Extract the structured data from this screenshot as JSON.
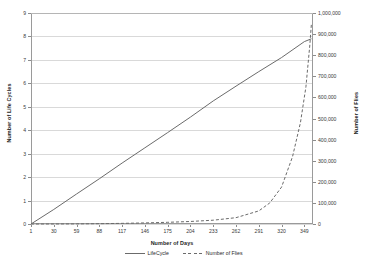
{
  "chart_data": {
    "type": "line",
    "title": "",
    "xlabel": "Number of Days",
    "ylabel": "Number of Life Cycles",
    "y2label": "Number of Flies",
    "xlim": [
      1,
      360
    ],
    "ylim": [
      0,
      9
    ],
    "y2lim": [
      0,
      1000000
    ],
    "grid": true,
    "legend_position": "bottom",
    "x_ticks": [
      "1",
      "30",
      "59",
      "88",
      "117",
      "146",
      "175",
      "204",
      "233",
      "262",
      "291",
      "320",
      "349"
    ],
    "y_left_ticks": [
      "0",
      "1",
      "2",
      "3",
      "4",
      "5",
      "6",
      "7",
      "8",
      "9"
    ],
    "y_right_ticks": [
      "0",
      "100,000",
      "200,000",
      "300,000",
      "400,000",
      "500,000",
      "600,000",
      "700,000",
      "800,000",
      "900,000",
      "1,000,000"
    ],
    "series": [
      {
        "name": "LifeCycle",
        "axis": "left",
        "style": "solid",
        "color": "#6b6b6b",
        "x": [
          1,
          30,
          59,
          88,
          117,
          146,
          175,
          204,
          233,
          262,
          291,
          320,
          349,
          358
        ],
        "values": [
          0,
          0.62,
          1.28,
          1.93,
          2.6,
          3.25,
          3.9,
          4.56,
          5.25,
          5.88,
          6.5,
          7.1,
          7.78,
          7.9
        ]
      },
      {
        "name": "Number of Flies",
        "axis": "right",
        "style": "dashed",
        "color": "#6b6b6b",
        "x": [
          1,
          30,
          59,
          88,
          117,
          146,
          175,
          204,
          233,
          262,
          291,
          305,
          320,
          334,
          344,
          351,
          356,
          358
        ],
        "values": [
          0,
          200,
          600,
          1500,
          3000,
          5000,
          8000,
          12000,
          18000,
          30000,
          62000,
          100000,
          175000,
          320000,
          480000,
          650000,
          850000,
          950000
        ]
      }
    ]
  },
  "axes": {
    "x_title": "Number of Days",
    "y_left_title": "Number of Life Cycles",
    "y_right_title": "Number of Flies"
  },
  "legend": {
    "entries": [
      {
        "label": "LifeCycle",
        "style": "solid"
      },
      {
        "label": "Number of Flies",
        "style": "dashed"
      }
    ]
  }
}
